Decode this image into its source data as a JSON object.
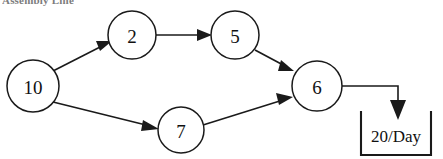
{
  "title": {
    "text": "Assembly Line",
    "clipped": true
  },
  "diagram": {
    "type": "directed-flow-network",
    "nodes": [
      {
        "id": "node-10",
        "label": "10",
        "cx": 33,
        "cy": 86,
        "r": 26
      },
      {
        "id": "node-2",
        "label": "2",
        "cx": 132,
        "cy": 35,
        "r": 24
      },
      {
        "id": "node-5",
        "label": "5",
        "cx": 235,
        "cy": 35,
        "r": 24
      },
      {
        "id": "node-6",
        "label": "6",
        "cx": 317,
        "cy": 86,
        "r": 25
      },
      {
        "id": "node-7",
        "label": "7",
        "cx": 181,
        "cy": 130,
        "r": 23
      }
    ],
    "edges": [
      {
        "id": "edge-10-2",
        "from": "10",
        "to": "2"
      },
      {
        "id": "edge-2-5",
        "from": "2",
        "to": "5"
      },
      {
        "id": "edge-5-6",
        "from": "5",
        "to": "6"
      },
      {
        "id": "edge-10-7",
        "from": "10",
        "to": "7"
      },
      {
        "id": "edge-7-6",
        "from": "7",
        "to": "6"
      }
    ],
    "output": {
      "id": "output-flow",
      "from": "6",
      "label": "20/Day",
      "bracket": {
        "x": 360,
        "y": 112,
        "width": 72,
        "height": 44
      }
    },
    "colors": {
      "stroke": "#1a1a1a",
      "fill": "#ffffff",
      "text": "#111111",
      "title": "#4a4a4a"
    }
  }
}
